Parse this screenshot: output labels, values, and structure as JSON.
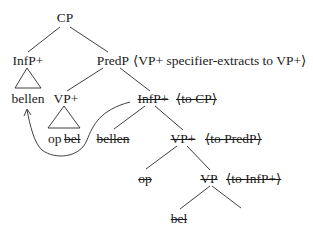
{
  "diagram": {
    "type": "syntax-tree",
    "nodes": {
      "root": "CP",
      "infp_top": "InfP+",
      "predp": "PredP",
      "predp_note": "⟨VP+ specifier-extracts to VP+⟩",
      "infp_top_leaf": "bellen",
      "vp_plus": "VP+",
      "vp_plus_leaf": "op",
      "vp_plus_leaf_struck": "bel",
      "infp_low": "InfP+",
      "infp_low_note": "⟨to CP⟩",
      "bellen_struck": "bellen",
      "vp_plus_low": "VP+",
      "vp_plus_low_note": "⟨to PredP⟩",
      "op_struck": "op",
      "vp_low": "VP",
      "vp_low_note": "⟨to InfP+⟩",
      "bel_struck": "bel"
    },
    "movement_arrow": {
      "from": "InfP+ (to CP)",
      "to": "bellen under InfP+"
    }
  }
}
